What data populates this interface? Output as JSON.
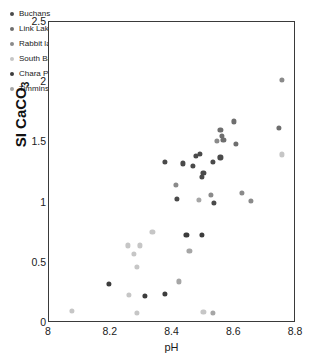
{
  "chart_data": {
    "type": "scatter",
    "title": "",
    "xlabel": "pH",
    "ylabel": "SI CaCO3",
    "ylabel_main": "SI CaCO",
    "ylabel_sub": "3",
    "xlim": [
      8,
      8.8
    ],
    "ylim": [
      0,
      2.5
    ],
    "xticks": [
      "8",
      "8.2",
      "8.4",
      "8.6",
      "8.8"
    ],
    "xtick_values": [
      8,
      8.2,
      8.4,
      8.6,
      8.8
    ],
    "yticks": [
      "0",
      "0.5",
      "1",
      "1.5",
      "2",
      "2.5"
    ],
    "ytick_values": [
      0,
      0.5,
      1,
      1.5,
      2,
      2.5
    ],
    "grid": false,
    "legend_position": "top-left",
    "series": [
      {
        "name": "Buchans",
        "color": "#4a4a4a",
        "points": [
          [
            8.375,
            1.335
          ],
          [
            8.435,
            1.325
          ],
          [
            8.465,
            1.305
          ],
          [
            8.5,
            1.245
          ],
          [
            8.495,
            1.215
          ],
          [
            8.53,
            1.335
          ],
          [
            8.555,
            1.375
          ],
          [
            8.49,
            1.405
          ],
          [
            8.475,
            1.39
          ],
          [
            8.415,
            1.03
          ],
          [
            8.535,
            0.995
          ]
        ]
      },
      {
        "name": "Link Lake",
        "color": "#6e6e6e",
        "points": [
          [
            8.555,
            1.605
          ],
          [
            8.56,
            1.555
          ],
          [
            8.565,
            1.52
          ],
          [
            8.6,
            1.675
          ],
          [
            8.605,
            1.49
          ],
          [
            8.745,
            1.62
          ]
        ]
      },
      {
        "name": "Rabbit lake",
        "color": "#8a8a8a",
        "points": [
          [
            8.41,
            1.145
          ],
          [
            8.545,
            1.51
          ],
          [
            8.525,
            1.065
          ],
          [
            8.625,
            1.08
          ],
          [
            8.655,
            1.015
          ],
          [
            8.755,
            2.02
          ]
        ]
      },
      {
        "name": "South Bay",
        "color": "#c6c6c6",
        "points": [
          [
            8.075,
            0.1
          ],
          [
            8.255,
            0.645
          ],
          [
            8.275,
            0.575
          ],
          [
            8.285,
            0.465
          ],
          [
            8.295,
            0.645
          ],
          [
            8.335,
            0.755
          ],
          [
            8.26,
            0.235
          ],
          [
            8.285,
            0.085
          ],
          [
            8.5,
            0.09
          ],
          [
            8.755,
            1.4
          ]
        ]
      },
      {
        "name": "Chara Pond",
        "color": "#3c3c3c",
        "points": [
          [
            8.195,
            0.325
          ],
          [
            8.31,
            0.225
          ],
          [
            8.375,
            0.245
          ],
          [
            8.445,
            0.735
          ],
          [
            8.495,
            0.735
          ]
        ]
      },
      {
        "name": "Timmins",
        "color": "#a6a6a6",
        "points": [
          [
            8.42,
            0.345
          ],
          [
            8.455,
            0.6
          ],
          [
            8.53,
            0.085
          ],
          [
            8.485,
            1.02
          ]
        ]
      }
    ]
  }
}
